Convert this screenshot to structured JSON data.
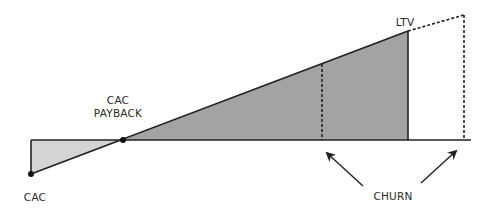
{
  "diagram": {
    "labels": {
      "cac": "CAC",
      "cac_payback_line1": "CAC",
      "cac_payback_line2": "PAYBACK",
      "ltv": "LTV",
      "churn": "CHURN"
    },
    "colors": {
      "line": "#222222",
      "profit_fill": "#a3a3a3",
      "cost_fill": "#d4d4d4",
      "background": "#ffffff"
    }
  }
}
